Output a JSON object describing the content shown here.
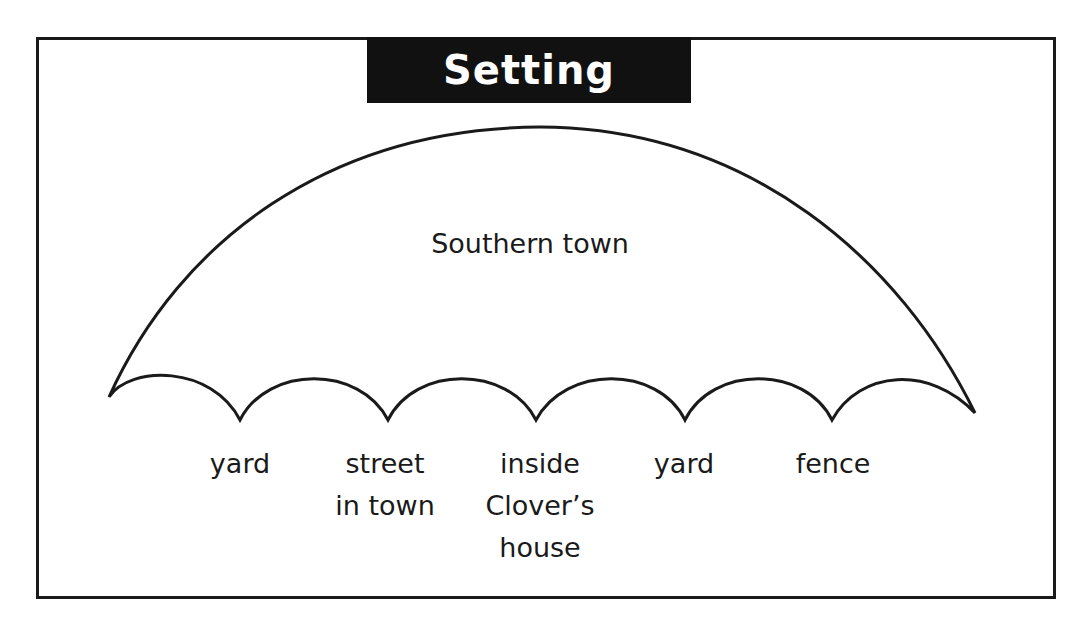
{
  "title": "Setting",
  "umbrella": {
    "main_setting": "Southern town",
    "sub_settings": [
      {
        "lines": [
          "yard"
        ],
        "x": 240
      },
      {
        "lines": [
          "street",
          "in town"
        ],
        "x": 385
      },
      {
        "lines": [
          "inside",
          "Clover’s",
          "house"
        ],
        "x": 540
      },
      {
        "lines": [
          "yard"
        ],
        "x": 684
      },
      {
        "lines": [
          "fence"
        ],
        "x": 833
      }
    ]
  },
  "colors": {
    "title_bg": "#111111",
    "title_text": "#ffffff",
    "line": "#1a1a1a",
    "background": "#ffffff"
  }
}
